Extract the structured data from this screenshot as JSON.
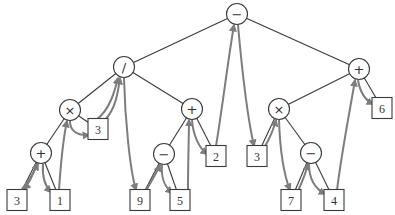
{
  "diagram": {
    "type": "expression-tree-euler-tour",
    "colors": {
      "edge": "#3a3a3a",
      "arrow": "#7d7d7d",
      "background": "#ffffff"
    },
    "nodes": [
      {
        "id": "n0",
        "kind": "op",
        "label": "−",
        "x": 237,
        "y": 14
      },
      {
        "id": "n1",
        "kind": "op",
        "label": "/",
        "x": 124,
        "y": 67
      },
      {
        "id": "n2",
        "kind": "op",
        "label": "+",
        "x": 359,
        "y": 69
      },
      {
        "id": "n3",
        "kind": "op",
        "label": "×",
        "x": 70,
        "y": 110
      },
      {
        "id": "n4",
        "kind": "op",
        "label": "+",
        "x": 192,
        "y": 109
      },
      {
        "id": "n5",
        "kind": "op",
        "label": "×",
        "x": 279,
        "y": 109
      },
      {
        "id": "n6",
        "kind": "leaf",
        "label": "6",
        "x": 382,
        "y": 108
      },
      {
        "id": "n7",
        "kind": "op",
        "label": "+",
        "x": 41,
        "y": 153
      },
      {
        "id": "n8",
        "kind": "leaf",
        "label": "3",
        "x": 98,
        "y": 129
      },
      {
        "id": "n9",
        "kind": "op",
        "label": "−",
        "x": 164,
        "y": 154
      },
      {
        "id": "n10",
        "kind": "leaf",
        "label": "2",
        "x": 216,
        "y": 156
      },
      {
        "id": "n11",
        "kind": "leaf",
        "label": "3",
        "x": 257,
        "y": 156
      },
      {
        "id": "n12",
        "kind": "op",
        "label": "−",
        "x": 311,
        "y": 153
      },
      {
        "id": "n13",
        "kind": "leaf",
        "label": "3",
        "x": 17,
        "y": 200
      },
      {
        "id": "n14",
        "kind": "leaf",
        "label": "1",
        "x": 60,
        "y": 200
      },
      {
        "id": "n15",
        "kind": "leaf",
        "label": "9",
        "x": 140,
        "y": 200
      },
      {
        "id": "n16",
        "kind": "leaf",
        "label": "5",
        "x": 180,
        "y": 200
      },
      {
        "id": "n17",
        "kind": "leaf",
        "label": "7",
        "x": 291,
        "y": 200
      },
      {
        "id": "n18",
        "kind": "leaf",
        "label": "4",
        "x": 334,
        "y": 200
      }
    ],
    "edges": [
      [
        "n0",
        "n1"
      ],
      [
        "n0",
        "n2"
      ],
      [
        "n1",
        "n3"
      ],
      [
        "n1",
        "n4"
      ],
      [
        "n2",
        "n5"
      ],
      [
        "n2",
        "n6"
      ],
      [
        "n3",
        "n7"
      ],
      [
        "n3",
        "n8"
      ],
      [
        "n4",
        "n9"
      ],
      [
        "n4",
        "n10"
      ],
      [
        "n5",
        "n11"
      ],
      [
        "n5",
        "n12"
      ],
      [
        "n7",
        "n13"
      ],
      [
        "n7",
        "n14"
      ],
      [
        "n9",
        "n15"
      ],
      [
        "n9",
        "n16"
      ],
      [
        "n12",
        "n17"
      ],
      [
        "n12",
        "n18"
      ]
    ]
  }
}
